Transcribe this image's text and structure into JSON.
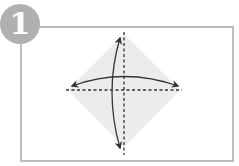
{
  "step": {
    "number": "1",
    "badge_color": "#b0b0b0",
    "text_color": "#ffffff"
  },
  "frame": {
    "border_color": "#bdbdbd"
  },
  "diagram": {
    "type": "origami-fold-instruction",
    "paper_shape": "diamond (square rotated 45°)",
    "paper_color": "#ececec",
    "fold_lines": [
      {
        "orientation": "horizontal",
        "style": "dashed"
      },
      {
        "orientation": "vertical",
        "style": "dashed"
      }
    ],
    "arrows": [
      {
        "direction": "left-right",
        "heads": "double",
        "curve": "arc above horizontal fold"
      },
      {
        "direction": "top-bottom",
        "heads": "double",
        "curve": "arc left of vertical fold"
      }
    ],
    "line_color": "#333333"
  }
}
